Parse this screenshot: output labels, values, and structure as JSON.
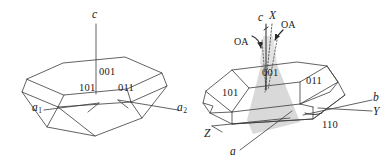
{
  "figure": {
    "kind": "crystal-morphology-diagram",
    "panels": [
      {
        "id": "left",
        "name": "hexagonal-plate-crystal",
        "axes": [
          {
            "label": "c",
            "italic": true
          },
          {
            "label": "a",
            "sub": "1",
            "italic": true
          },
          {
            "label": "a",
            "sub": "2",
            "italic": true
          }
        ],
        "faces": [
          {
            "label": "001"
          },
          {
            "label": "101"
          },
          {
            "label": "011"
          }
        ]
      },
      {
        "id": "right",
        "name": "optic-axial-plate-crystal",
        "axes": [
          {
            "label": "c",
            "italic": true
          },
          {
            "label": "X",
            "italic": true
          },
          {
            "label": "Z",
            "italic": true
          },
          {
            "label": "a",
            "italic": true
          },
          {
            "label": "b",
            "italic": true
          },
          {
            "label": "Y",
            "italic": true
          }
        ],
        "optic_axes": [
          {
            "label": "OA",
            "side": "left"
          },
          {
            "label": "OA",
            "side": "right"
          }
        ],
        "faces": [
          {
            "label": "001"
          },
          {
            "label": "101"
          },
          {
            "label": "011"
          },
          {
            "label": "110"
          }
        ]
      }
    ],
    "colors": {
      "stroke": "#3a3a3a",
      "label": "#1a1a1a",
      "shade": "#d9d9d9",
      "shade_edge": "#c9c9c9",
      "background": "#ffffff"
    }
  }
}
